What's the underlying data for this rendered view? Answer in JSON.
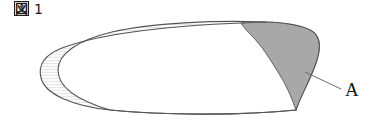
{
  "figure": {
    "caption_mark": "図",
    "caption_number": "1",
    "label_a": "A",
    "colors": {
      "outline": "#555555",
      "shaded_region": "#a8a8a8",
      "shaded_region_outline": "#777777",
      "light_region": "#f7f7f7",
      "light_region_hatch": "#d8d8d8",
      "leader_line": "#6b6b6b",
      "text": "#1a1a1a",
      "background": "#ffffff"
    },
    "geometry": {
      "outer_leftmost_x": 38,
      "inner_leftmost_x": 58,
      "rightmost_x": 320,
      "top_y": 22,
      "bottom_y": 112,
      "top_convergence": [
        265,
        22
      ],
      "bottom_right_convergence": [
        296,
        110
      ],
      "bottom_left_convergence": [
        110,
        110
      ],
      "leader_start": [
        305,
        72
      ],
      "leader_end": [
        341,
        89
      ],
      "label_a_position": [
        345,
        96
      ]
    }
  }
}
